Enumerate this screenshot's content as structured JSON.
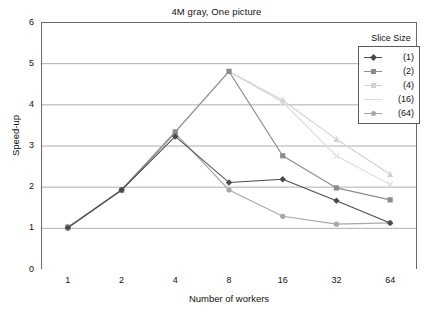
{
  "chart_data": {
    "type": "line",
    "title": "4M gray, One picture",
    "xlabel": "Number of workers",
    "ylabel": "Speed-up",
    "categories": [
      "1",
      "2",
      "4",
      "8",
      "16",
      "32",
      "64"
    ],
    "x_tick_labels": [
      "1",
      "2",
      "4",
      "8",
      "16",
      "32",
      "64"
    ],
    "y_tick_labels": [
      "0",
      "1",
      "2",
      "3",
      "4",
      "5",
      "6"
    ],
    "ylim": [
      0,
      6
    ],
    "y_major_step": 1,
    "grid": "horizontal",
    "legend_position": "top-right",
    "legend_title": "Slice Size",
    "series": [
      {
        "name": "(1)",
        "color": "#4a4a4a",
        "marker": "diamond",
        "values": [
          1.0,
          1.92,
          3.22,
          2.1,
          2.18,
          1.66,
          1.12
        ]
      },
      {
        "name": "(2)",
        "color": "#8c8c8c",
        "marker": "square",
        "values": [
          1.02,
          1.92,
          3.33,
          4.8,
          2.75,
          1.97,
          1.68
        ]
      },
      {
        "name": "(4)",
        "color": "#d2d2d2",
        "marker": "triangle",
        "values": [
          1.0,
          1.92,
          3.33,
          4.8,
          4.1,
          3.15,
          2.3
        ]
      },
      {
        "name": "(16)",
        "color": "#dcdcdc",
        "marker": "cross",
        "values": [
          1.0,
          1.92,
          3.33,
          4.8,
          4.05,
          2.75,
          2.05
        ]
      },
      {
        "name": "(64)",
        "color": "#a8a8a8",
        "marker": "circle",
        "values": [
          1.0,
          1.92,
          3.3,
          1.92,
          1.28,
          1.09,
          1.12
        ]
      }
    ]
  },
  "axis_color": "#6b6b6b",
  "grid_color": "#9a9a9a"
}
